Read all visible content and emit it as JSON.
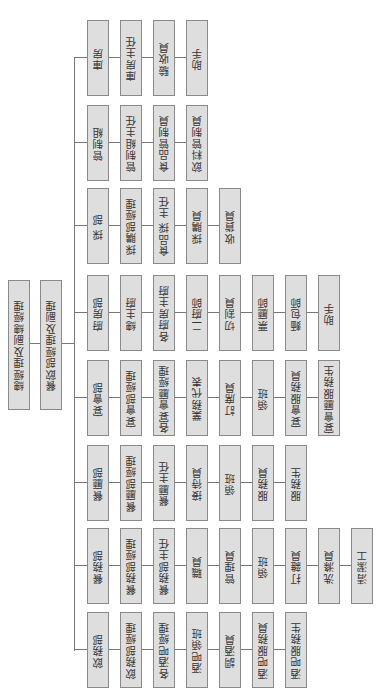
{
  "diagram": {
    "type": "org-chart",
    "orientation": "rotated-90-ccw",
    "root": [
      {
        "label": "總經理及副總經理"
      },
      {
        "label": "餐飲部經理及副理"
      }
    ],
    "departments": [
      {
        "name": "庫房",
        "members": [
          "庫房主任",
          "驗收員",
          "助手"
        ]
      },
      {
        "name": "管制組",
        "members": [
          "管制組主任",
          "食品管制員",
          "飲料管制員"
        ]
      },
      {
        "name": "採 部",
        "members": [
          "採購部經理",
          "食品採 主任",
          "採購員",
          "收貨員"
        ]
      },
      {
        "name": "廚房部",
        "members": [
          "總主廚",
          "各廚房主廚",
          "二廚師",
          "切割員",
          "票廳師",
          "麵包師",
          "助手"
        ]
      },
      {
        "name": "宴會部",
        "members": [
          "宴會部經理",
          "各宴會廳經理",
          "業務代表",
          "訂席員",
          "領班",
          "宴會服務員",
          "宴會廳服務生"
        ]
      },
      {
        "name": "餐廳部",
        "members": [
          "餐廳部經理",
          "餐廳主任",
          "接待員",
          "領班",
          "服務員",
          "服務生"
        ]
      },
      {
        "name": "餐務部",
        "members": [
          "餐務部經理",
          "餐務部主任",
          "職員",
          "管理員",
          "領班",
          "打雜員",
          "洗滌員",
          "清潔工"
        ]
      },
      {
        "name": "飲務部",
        "members": [
          "飲務部經理",
          "各酒吧經理",
          "酒吧領班",
          "調酒員",
          "酒吧服務員",
          "酒吧服務生"
        ]
      }
    ],
    "colors": {
      "box_fill": "#dedede",
      "box_border": "#8a8a8a",
      "line": "#777777",
      "text": "#333333"
    }
  }
}
